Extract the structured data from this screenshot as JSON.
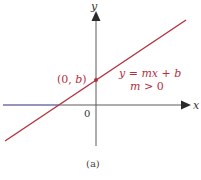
{
  "figure": {
    "caption": "(a)",
    "axes": {
      "x_label": "x",
      "y_label": "y",
      "origin_label": "0"
    },
    "point": {
      "label_open": "(0, ",
      "label_var": "b",
      "label_close": ")"
    },
    "equation": {
      "line1_y": "y",
      "line1_eq": " = ",
      "line1_mx": "mx",
      "line1_plus": " + ",
      "line1_b": "b",
      "line2_m": "m",
      "line2_rest": " > 0"
    },
    "colors": {
      "line": "#b5303f",
      "axis": "#333333",
      "label": "#b5303f",
      "axis_left_tint": "#7b7fd0"
    }
  }
}
